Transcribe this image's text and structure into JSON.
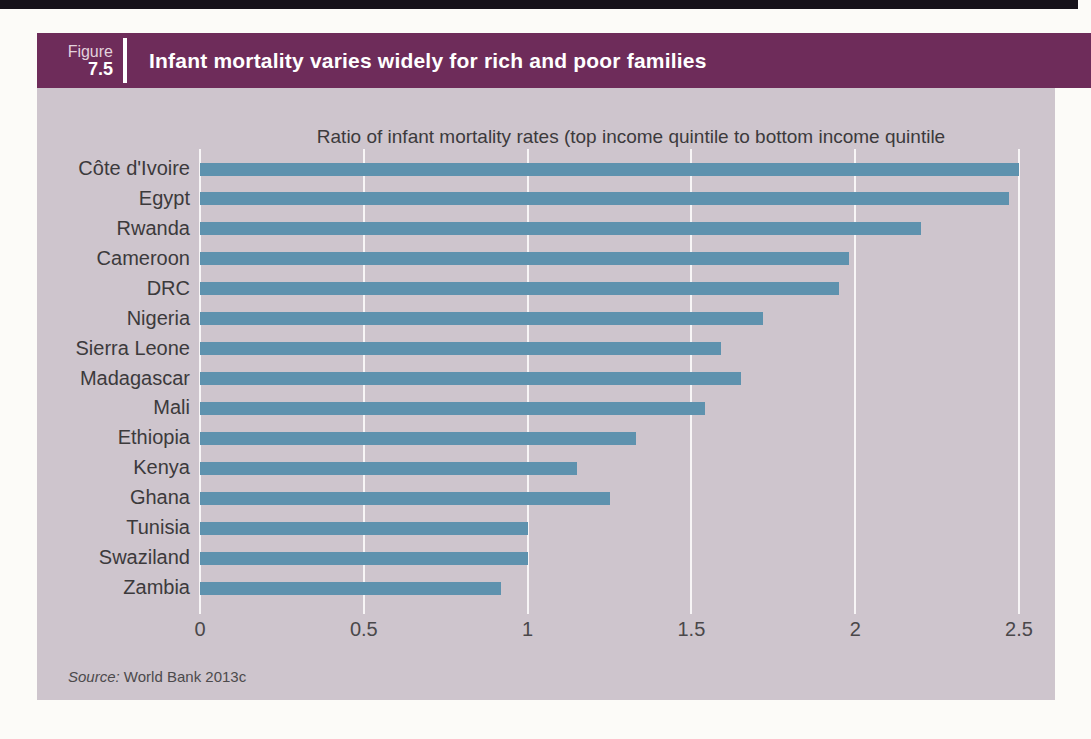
{
  "page": {
    "figure_label": "Figure",
    "figure_number": "7.5",
    "title": "Infant mortality varies widely for rich and poor families",
    "source_prefix": "Source:",
    "source_text": " World Bank 2013c"
  },
  "chart_data": {
    "type": "bar",
    "orientation": "horizontal",
    "title": "Infant mortality varies widely for rich and poor families",
    "subtitle": "Ratio of infant mortality rates (top income quintile to bottom income quintile",
    "categories": [
      "Côte d'Ivoire",
      "Egypt",
      "Rwanda",
      "Cameroon",
      "DRC",
      "Nigeria",
      "Sierra Leone",
      "Madagascar",
      "Mali",
      "Ethiopia",
      "Kenya",
      "Ghana",
      "Tunisia",
      "Swaziland",
      "Zambia"
    ],
    "values": [
      2.5,
      2.47,
      2.2,
      1.98,
      1.95,
      1.72,
      1.59,
      1.65,
      1.54,
      1.33,
      1.15,
      1.25,
      1.0,
      1.0,
      0.92
    ],
    "xlim": [
      0,
      2.5
    ],
    "xticks": [
      0,
      0.5,
      1,
      1.5,
      2,
      2.5
    ],
    "xtick_labels": [
      "0",
      "0.5",
      "1",
      "1.5",
      "2",
      "2.5"
    ],
    "grid": "vertical-white-gridlines",
    "legend": "none",
    "bar_color": "#5e92ae",
    "plot_background_color": "#cec5cd",
    "header_color": "#6e2c5a",
    "source": "Source: World Bank 2013c"
  }
}
